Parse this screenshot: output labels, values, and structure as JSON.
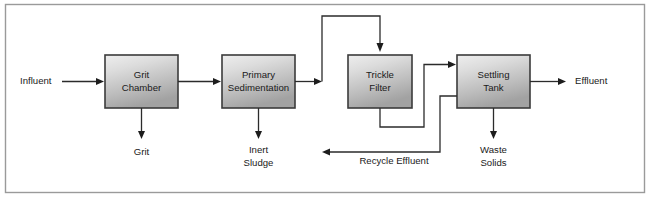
{
  "diagram": {
    "colors": {
      "frame_border": "#9a9a9a",
      "box_border": "#3b3b3b",
      "box_fill_light": "#e8e8e8",
      "box_fill_dark": "#a9a9a9",
      "line": "#2b2b2b",
      "text": "#1a1a1a",
      "background": "#ffffff"
    },
    "units": [
      {
        "id": "grit-chamber",
        "label_line1": "Grit",
        "label_line2": "Chamber"
      },
      {
        "id": "primary-sedimentation",
        "label_line1": "Primary",
        "label_line2": "Sedimentation"
      },
      {
        "id": "trickle-filter",
        "label_line1": "Trickle",
        "label_line2": "Filter"
      },
      {
        "id": "settling-tank",
        "label_line1": "Settling",
        "label_line2": "Tank"
      }
    ],
    "streams": [
      {
        "id": "influent",
        "label": "Influent"
      },
      {
        "id": "grit",
        "label": "Grit"
      },
      {
        "id": "inert-sludge",
        "label_line1": "Inert",
        "label_line2": "Sludge"
      },
      {
        "id": "recycle-effluent",
        "label": "Recycle Effluent"
      },
      {
        "id": "waste-solids",
        "label_line1": "Waste",
        "label_line2": "Solids"
      },
      {
        "id": "effluent",
        "label": "Effluent"
      }
    ]
  }
}
